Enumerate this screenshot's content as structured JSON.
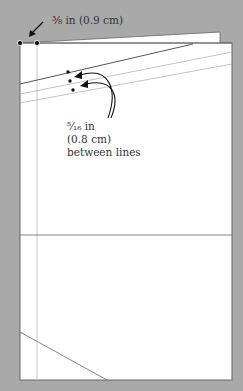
{
  "diagram": {
    "top_measurement": "⅜ in (0.9 cm)",
    "spacing_label": {
      "line1": "⁵⁄₁₆ in",
      "line2": "(0.8 cm)",
      "line3": "between lines"
    },
    "colors": {
      "background": "#a9a9a9",
      "paper": "#ffffff",
      "outline": "#555555",
      "guide_line": "#c8c8c8",
      "ink": "#222222"
    }
  }
}
